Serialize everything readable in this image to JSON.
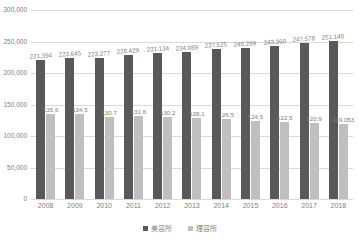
{
  "title_sliver": "",
  "chart_data": {
    "type": "bar",
    "title": "",
    "xlabel": "",
    "ylabel": "",
    "ylim": [
      0,
      300000
    ],
    "yticks": [
      "0",
      "50,000",
      "100,000",
      "150,000",
      "200,000",
      "250,000",
      "300,000"
    ],
    "ytick_values": [
      0,
      50000,
      100000,
      150000,
      200000,
      250000,
      300000
    ],
    "grid": true,
    "legend_position": "bottom",
    "categories": [
      "2008",
      "2009",
      "2010",
      "2011",
      "2012",
      "2013",
      "2014",
      "2015",
      "2016",
      "2017",
      "2018"
    ],
    "series": [
      {
        "name": "美容所",
        "color": "#595959",
        "values": [
          221394,
          223645,
          223277,
          228429,
          231134,
          234089,
          237525,
          240299,
          243360,
          247578,
          251140
        ],
        "labels": [
          "221,394",
          "223,645",
          "223,277",
          "228,429",
          "231,134",
          "234,089",
          "237,525",
          "240,299",
          "243,360",
          "247,578",
          "251,140"
        ]
      },
      {
        "name": "理容所",
        "color": "#bfbfbf",
        "values": [
          135600,
          134500,
          130700,
          131600,
          130200,
          128100,
          126500,
          124500,
          122500,
          120900,
          119053
        ],
        "labels": [
          "135,6",
          "134,5",
          "130,7",
          "131,6",
          "130,2",
          "128,1",
          "126,5",
          "124,5",
          "122,5",
          "120,9",
          "119,053"
        ]
      }
    ]
  },
  "legend": {
    "items": [
      {
        "label": "美容所",
        "color": "#595959"
      },
      {
        "label": "理容所",
        "color": "#bfbfbf"
      }
    ]
  }
}
